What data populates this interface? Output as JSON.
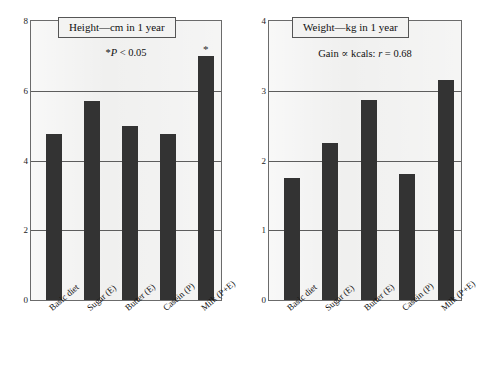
{
  "chart_data": [
    {
      "type": "bar",
      "panel": "left",
      "title": "Height—cm in 1 year",
      "subtitle": "*P < 0.05",
      "subtitle_prefix": "*",
      "subtitle_italic": "P",
      "subtitle_rest": " < 0.05",
      "xlabel": "",
      "ylabel": "",
      "ylim": [
        0,
        8
      ],
      "yticks": [
        0,
        2,
        4,
        6,
        8
      ],
      "ytick_labels": [
        "0",
        "2",
        "4",
        "6",
        "8"
      ],
      "grid": true,
      "legend": "none",
      "categories": [
        "Basic diet",
        "Sugar (E)",
        "Butter (E)",
        "Casein (P)",
        "Milk (P+E)"
      ],
      "values": [
        4.75,
        5.7,
        5.0,
        4.75,
        7.0
      ],
      "annotations": [
        {
          "category": "Milk (P+E)",
          "text": "*",
          "index": 4
        }
      ]
    },
    {
      "type": "bar",
      "panel": "right",
      "title": "Weight—kg in 1 year",
      "subtitle": "Gain ∝ kcals: r = 0.68",
      "subtitle_prefix": "Gain ∝ kcals: ",
      "subtitle_italic": "r",
      "subtitle_rest": " = 0.68",
      "xlabel": "",
      "ylabel": "",
      "ylim": [
        0,
        4
      ],
      "yticks": [
        0,
        1,
        2,
        3,
        4
      ],
      "ytick_labels": [
        "0",
        "1",
        "2",
        "3",
        "4"
      ],
      "grid": true,
      "legend": "none",
      "categories": [
        "Basic diet",
        "Sugar (E)",
        "Butter (E)",
        "Casein (P)",
        "Milk (P+E)"
      ],
      "values": [
        1.75,
        2.25,
        2.87,
        1.8,
        3.15
      ],
      "annotations": []
    }
  ],
  "colors": {
    "bar_fill": "#333333",
    "plot_background": "#f0f0ef",
    "axis_line": "#6b6b6b",
    "gridline": "#5d5d5d",
    "text": "#111111",
    "page_background": "#ffffff"
  },
  "left_panel": {
    "title": "Height—cm in 1 year",
    "subtitle_prefix": "*",
    "subtitle_italic": "P",
    "subtitle_rest": " < 0.05",
    "ytick_labels": [
      "0",
      "2",
      "4",
      "6",
      "8"
    ],
    "categories": [
      "Basic diet",
      "Sugar (E)",
      "Butter (E)",
      "Casein (P)",
      "Milk (P+E)"
    ],
    "star": "*"
  },
  "right_panel": {
    "title": "Weight—kg in 1 year",
    "subtitle_prefix": "Gain ∝ kcals: ",
    "subtitle_italic": "r",
    "subtitle_rest": " = 0.68",
    "ytick_labels": [
      "0",
      "1",
      "2",
      "3",
      "4"
    ],
    "categories": [
      "Basic diet",
      "Sugar (E)",
      "Butter (E)",
      "Casein (P)",
      "Milk (P+E)"
    ]
  }
}
